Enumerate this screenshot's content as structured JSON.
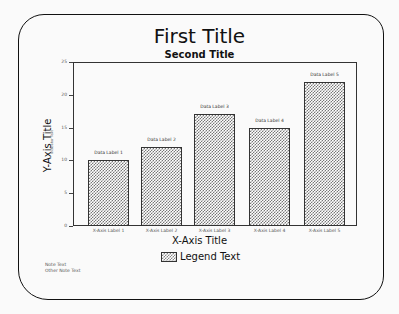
{
  "chart_data": {
    "type": "bar",
    "title": "First Title",
    "subtitle": "Second Title",
    "xlabel": "X-Axis Title",
    "ylabel": "Y-Axis Title",
    "ylabel_sub": "Indicator Text",
    "ylim": [
      0,
      25
    ],
    "yticks": [
      0,
      5,
      10,
      15,
      20,
      25
    ],
    "categories": [
      "X-Axis Label 1",
      "X-Axis Label 2",
      "X-Axis Label 3",
      "X-Axis Label 4",
      "X-Axis Label 5"
    ],
    "values": [
      10,
      12,
      17,
      15,
      22
    ],
    "data_labels": [
      "Data Label 1",
      "Data Label 2",
      "Data Label 3",
      "Data Label 4",
      "Data Label 5"
    ],
    "legend": [
      "Legend Text"
    ],
    "legend_position": "bottom",
    "grid": false,
    "notes": [
      "Note Text",
      "Other Note Text"
    ]
  }
}
